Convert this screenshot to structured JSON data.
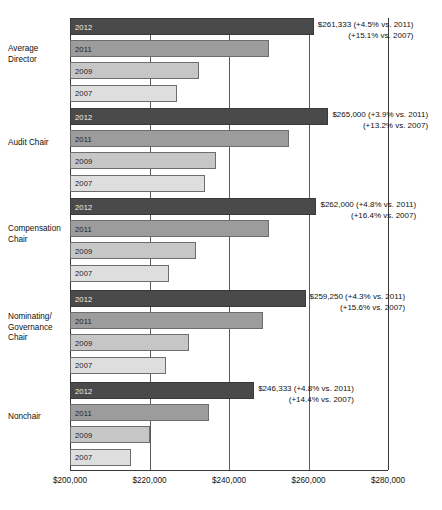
{
  "chart_data": {
    "type": "bar",
    "orientation": "horizontal",
    "title": "",
    "xlabel": "",
    "ylabel": "",
    "xlim": [
      200000,
      280000
    ],
    "xticks": [
      200000,
      220000,
      240000,
      260000,
      280000
    ],
    "xtick_labels": [
      "$200,000",
      "$220,000",
      "$240,000",
      "$260,000",
      "$280,000"
    ],
    "grid": true,
    "legend": "none",
    "series_order": [
      "2012",
      "2011",
      "2009",
      "2007"
    ],
    "series_colors": {
      "2012": "#4a4a4a",
      "2011": "#9c9c9c",
      "2009": "#c6c6c6",
      "2007": "#dedede"
    },
    "categories": [
      "Average Director",
      "Audit Chair",
      "Compensation Chair",
      "Nominating/ Governance Chair",
      "Nonchair"
    ],
    "series": [
      {
        "name": "2012",
        "values": [
          261333,
          265000,
          262000,
          259250,
          246333
        ]
      },
      {
        "name": "2011",
        "values": [
          250000,
          255000,
          250000,
          248500,
          235000
        ]
      },
      {
        "name": "2009",
        "values": [
          232500,
          236700,
          231700,
          230000,
          220000
        ]
      },
      {
        "name": "2007",
        "values": [
          227000,
          234000,
          225000,
          224250,
          215400
        ]
      }
    ],
    "groups": [
      {
        "label_lines": [
          "Average",
          "Director"
        ],
        "bars": [
          {
            "year": "2012",
            "value": 261333
          },
          {
            "year": "2011",
            "value": 250000
          },
          {
            "year": "2009",
            "value": 232500
          },
          {
            "year": "2007",
            "value": 227000
          }
        ],
        "callout_line1": "$261,333 (+4.5% vs. 2011)",
        "callout_line2": "(+15.1% vs.  2007)"
      },
      {
        "label_lines": [
          "Audit Chair"
        ],
        "bars": [
          {
            "year": "2012",
            "value": 265000
          },
          {
            "year": "2011",
            "value": 255000
          },
          {
            "year": "2009",
            "value": 236700
          },
          {
            "year": "2007",
            "value": 234000
          }
        ],
        "callout_line1": "$265,000 (+3.9% vs. 2011)",
        "callout_line2": "(+13.2% vs.  2007)"
      },
      {
        "label_lines": [
          "Compensation",
          "Chair"
        ],
        "bars": [
          {
            "year": "2012",
            "value": 262000
          },
          {
            "year": "2011",
            "value": 250000
          },
          {
            "year": "2009",
            "value": 231700
          },
          {
            "year": "2007",
            "value": 225000
          }
        ],
        "callout_line1": "$262,000 (+4.8% vs. 2011)",
        "callout_line2": "(+16.4% vs.  2007)"
      },
      {
        "label_lines": [
          "Nominating/",
          "Governance",
          "Chair"
        ],
        "bars": [
          {
            "year": "2012",
            "value": 259250
          },
          {
            "year": "2011",
            "value": 248500
          },
          {
            "year": "2009",
            "value": 230000
          },
          {
            "year": "2007",
            "value": 224250
          }
        ],
        "callout_line1": "$259,250 (+4.3% vs. 2011)",
        "callout_line2": "(+15.6% vs.  2007)"
      },
      {
        "label_lines": [
          "Nonchair"
        ],
        "bars": [
          {
            "year": "2012",
            "value": 246333
          },
          {
            "year": "2011",
            "value": 235000
          },
          {
            "year": "2009",
            "value": 220000
          },
          {
            "year": "2007",
            "value": 215400
          }
        ],
        "callout_line1": "$246,333 (+4.8% vs. 2011)",
        "callout_line2": "(+14.4% vs.  2007)"
      }
    ]
  }
}
